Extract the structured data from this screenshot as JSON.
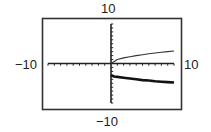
{
  "chart_data": {
    "type": "line",
    "title": "",
    "xlabel": "",
    "ylabel": "",
    "xlim": [
      -10,
      10
    ],
    "ylim": [
      -10,
      10
    ],
    "xscale": 1,
    "yscale": 1,
    "grid": false,
    "axis_labels": {
      "top": "10",
      "bottom": "-10",
      "left": "-10",
      "right": "10"
    },
    "series": [
      {
        "name": "upper-curve",
        "style": "thin",
        "color": "#333333",
        "x": [
          0,
          1,
          2,
          3,
          4,
          5,
          6,
          7,
          8,
          9,
          10
        ],
        "y": [
          0,
          1.0,
          1.41,
          1.73,
          2.0,
          2.24,
          2.45,
          2.65,
          2.83,
          3.0,
          3.16
        ]
      },
      {
        "name": "lower-curve",
        "style": "thick",
        "color": "#111111",
        "x": [
          0,
          0.5,
          1,
          2,
          3,
          4,
          5,
          6,
          7,
          8,
          9,
          10
        ],
        "y": [
          -3.0,
          -3.3,
          -3.4,
          -3.6,
          -3.8,
          -4.0,
          -4.2,
          -4.3,
          -4.5,
          -4.6,
          -4.7,
          -4.8
        ]
      }
    ]
  }
}
